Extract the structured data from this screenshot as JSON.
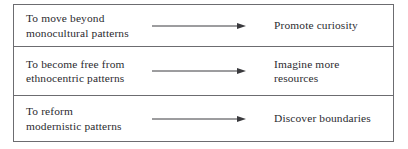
{
  "diagram": {
    "type": "three-row-arrow-table",
    "colors": {
      "border": "#6c6c70",
      "text": "#2b2b2f",
      "arrow": "#3a3a3e",
      "background": "#ffffff"
    },
    "rows": [
      {
        "source_line1": "To move beyond",
        "source_line2": "monocultural patterns",
        "arrow": "right-arrow",
        "target_line1": "Promote curiosity",
        "target_line2": ""
      },
      {
        "source_line1": "To become free from",
        "source_line2": "ethnocentric patterns",
        "arrow": "right-arrow",
        "target_line1": "Imagine more",
        "target_line2": "resources"
      },
      {
        "source_line1": "To reform",
        "source_line2": "modernistic patterns",
        "arrow": "right-arrow",
        "target_line1": "Discover boundaries",
        "target_line2": ""
      }
    ]
  }
}
